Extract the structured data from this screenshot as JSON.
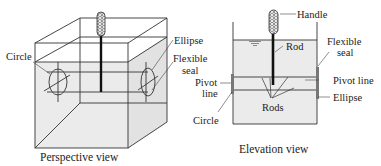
{
  "perspective_view": {
    "caption": "Perspective view",
    "labels": {
      "circle": "Circle",
      "ellipse": "Ellipse",
      "flexible_seal_line1": "Flexible",
      "flexible_seal_line2": "seal"
    }
  },
  "elevation_view": {
    "caption": "Elevation view",
    "labels": {
      "handle": "Handle",
      "rod": "Rod",
      "rods": "Rods",
      "flexible_seal_line1": "Flexible",
      "flexible_seal_line2": "seal",
      "pivot_line_left_line1": "Pivot",
      "pivot_line_left_line2": "line",
      "pivot_line_right": "Pivot line",
      "ellipse": "Ellipse",
      "circle": "Circle"
    }
  },
  "colors": {
    "water_fill": "#ebebeb",
    "line": "#333333",
    "rod": "#111111"
  }
}
